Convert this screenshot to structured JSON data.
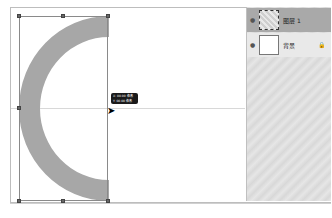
{
  "canvas": {
    "tooltip": {
      "line1": "X: 00.00 像素",
      "line2": "Y: 00.00 像素"
    }
  },
  "layers_panel": {
    "layers": [
      {
        "name": "图层 1",
        "visible": true,
        "selected": true,
        "icon": "eye-icon"
      },
      {
        "name": "背景",
        "visible": true,
        "selected": false,
        "locked": true,
        "icon": "eye-icon",
        "lock_icon": "lock-icon"
      }
    ]
  },
  "colors": {
    "ring_fill": "#a7a7a7",
    "selected_layer": "#a9a9a9",
    "panel_bg": "#dcdcdc"
  }
}
